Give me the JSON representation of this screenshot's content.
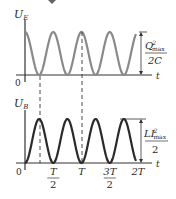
{
  "diagram": {
    "top_plot": {
      "y_label_main": "U",
      "y_label_sub": "E",
      "x_label": "t",
      "origin_label": "0",
      "amplitude_label_num": "Q",
      "amplitude_label_sup": "2",
      "amplitude_label_sub": "max",
      "amplitude_label_den": "2C",
      "curve_color": "#8a8a8a",
      "curve": "cos^2 (starts at max, period T/2)"
    },
    "bottom_plot": {
      "y_label_main": "U",
      "y_label_sub": "B",
      "x_label": "t",
      "origin_label": "0",
      "amplitude_label_num": "LI",
      "amplitude_label_sup": "2",
      "amplitude_label_sub": "max",
      "amplitude_label_den": "2",
      "curve_color": "#2a2a2a",
      "curve": "sin^2 (starts at zero, period T/2)"
    },
    "x_ticks": [
      {
        "num": "T",
        "den": "2"
      },
      {
        "num": "T",
        "den": ""
      },
      {
        "num": "3T",
        "den": "2"
      },
      {
        "num": "2T",
        "den": ""
      }
    ],
    "dashed_guides_at": [
      "T/4",
      "T"
    ]
  }
}
